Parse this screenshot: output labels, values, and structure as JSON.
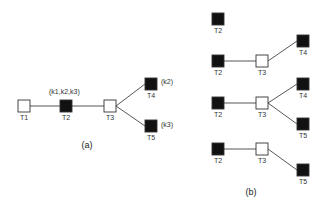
{
  "colors": {
    "background": "#ffffff",
    "filled": "#111111",
    "empty": "#ffffff",
    "stroke": "#333333",
    "edge": "#444444",
    "text": "#333333"
  },
  "node_size": 12,
  "panels": [
    {
      "id": "a",
      "caption": "(a)",
      "caption_pos": [
        87,
        148
      ],
      "nodes": [
        {
          "id": "T1",
          "label": "T1",
          "x": 18,
          "y": 100,
          "filled": false
        },
        {
          "id": "T2",
          "label": "T2",
          "x": 60,
          "y": 100,
          "filled": true
        },
        {
          "id": "T3",
          "label": "T3",
          "x": 104,
          "y": 100,
          "filled": false
        },
        {
          "id": "T4",
          "label": "T4",
          "x": 145,
          "y": 78,
          "filled": true
        },
        {
          "id": "T5",
          "label": "T5",
          "x": 145,
          "y": 120,
          "filled": true
        }
      ],
      "edges": [
        [
          "T1",
          "T2"
        ],
        [
          "T2",
          "T3"
        ],
        [
          "T3",
          "T4"
        ],
        [
          "T3",
          "T5"
        ]
      ],
      "annotations": [
        {
          "text": "(k1,k2,k3)",
          "x": 49,
          "y": 94
        },
        {
          "text": "(k2)",
          "x": 161,
          "y": 84
        },
        {
          "text": "(k3)",
          "x": 161,
          "y": 127
        }
      ]
    },
    {
      "id": "b",
      "caption": "(b)",
      "caption_pos": [
        251,
        195
      ],
      "subtrees": [
        {
          "nodes": [
            {
              "id": "T2",
              "label": "T2",
              "x": 212,
              "y": 13,
              "filled": true
            }
          ],
          "edges": []
        },
        {
          "nodes": [
            {
              "id": "T2",
              "label": "T2",
              "x": 212,
              "y": 55,
              "filled": true
            },
            {
              "id": "T3",
              "label": "T3",
              "x": 256,
              "y": 55,
              "filled": false
            },
            {
              "id": "T4",
              "label": "T4",
              "x": 297,
              "y": 35,
              "filled": true
            }
          ],
          "edges": [
            [
              "T2",
              "T3"
            ],
            [
              "T3",
              "T4"
            ]
          ]
        },
        {
          "nodes": [
            {
              "id": "T2",
              "label": "T2",
              "x": 212,
              "y": 97,
              "filled": true
            },
            {
              "id": "T3",
              "label": "T3",
              "x": 256,
              "y": 97,
              "filled": false
            },
            {
              "id": "T4",
              "label": "T4",
              "x": 297,
              "y": 78,
              "filled": true
            },
            {
              "id": "T5",
              "label": "T5",
              "x": 297,
              "y": 118,
              "filled": true
            }
          ],
          "edges": [
            [
              "T2",
              "T3"
            ],
            [
              "T3",
              "T4"
            ],
            [
              "T3",
              "T5"
            ]
          ]
        },
        {
          "nodes": [
            {
              "id": "T2",
              "label": "T2",
              "x": 212,
              "y": 143,
              "filled": true
            },
            {
              "id": "T3",
              "label": "T3",
              "x": 256,
              "y": 143,
              "filled": false
            },
            {
              "id": "T5",
              "label": "T5",
              "x": 297,
              "y": 164,
              "filled": true
            }
          ],
          "edges": [
            [
              "T2",
              "T3"
            ],
            [
              "T3",
              "T5"
            ]
          ]
        }
      ]
    }
  ]
}
